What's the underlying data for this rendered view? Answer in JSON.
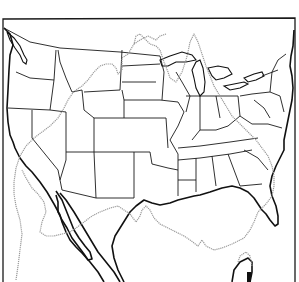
{
  "map": {
    "description": "Outline map of the contiguous United States with state borders and a dotted comparison outline overlaid",
    "colors": {
      "background": "#ffffff",
      "borders": "#1a1a1a",
      "overlay_outline": "#9a9a9a"
    },
    "layers": [
      {
        "name": "frame",
        "style": "solid"
      },
      {
        "name": "us-coastline",
        "style": "solid-thick"
      },
      {
        "name": "state-borders",
        "style": "solid-thin"
      },
      {
        "name": "comparison-outline",
        "style": "dotted-gray"
      }
    ],
    "features": [
      "Puget Sound",
      "Great Lakes",
      "Chesapeake Bay",
      "Florida peninsula",
      "Baja California",
      "Gulf of California",
      "Yucatan peninsula"
    ]
  }
}
